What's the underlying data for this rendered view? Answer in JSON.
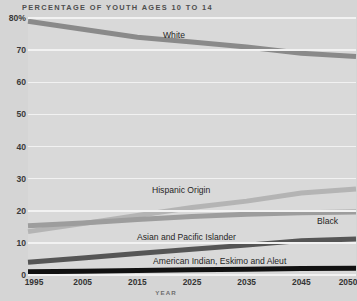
{
  "chart_data": {
    "type": "line",
    "title": "PERCENTAGE OF YOUTH AGES  10 TO 14",
    "xlabel": "YEAR",
    "ylabel": "",
    "grid": true,
    "legend_position": "inline-labels",
    "x": [
      1995,
      2005,
      2015,
      2025,
      2035,
      2045,
      2050
    ],
    "xticklabels": [
      "1995",
      "2005",
      "2015",
      "2025",
      "2035",
      "2045",
      "2050"
    ],
    "xlim": [
      1995,
      2050
    ],
    "ylim": [
      0,
      80
    ],
    "yticks": [
      0,
      10,
      20,
      30,
      40,
      50,
      60,
      70,
      80
    ],
    "yticklabels": [
      "0",
      "10",
      "20",
      "30",
      "40",
      "50",
      "60",
      "70",
      "80%"
    ],
    "series": [
      {
        "name": "White",
        "color": "#8a8a8a",
        "values": [
          79.0,
          76.5,
          74.0,
          72.5,
          71.0,
          69.0,
          68.0
        ]
      },
      {
        "name": "Hispanic Origin",
        "color": "#b4b4b4",
        "values": [
          13.5,
          16.0,
          18.5,
          21.0,
          23.0,
          25.5,
          26.8
        ]
      },
      {
        "name": "Black",
        "color": "#9d9d9d",
        "values": [
          15.3,
          16.2,
          17.3,
          18.2,
          18.9,
          19.4,
          19.6
        ]
      },
      {
        "name": "Asian and Pacific Islander",
        "color": "#555555",
        "values": [
          4.0,
          5.3,
          6.7,
          8.0,
          9.3,
          10.7,
          11.2
        ]
      },
      {
        "name": "American Indian, Eskimo and Aleut",
        "color": "#111111",
        "values": [
          1.0,
          1.2,
          1.4,
          1.6,
          1.8,
          2.0,
          2.1
        ]
      }
    ]
  },
  "labels": {
    "white": "White",
    "hispanic": "Hispanic Origin",
    "black": "Black",
    "asian": "Asian and Pacific Islander",
    "amerindian": "American Indian, Eskimo and Aleut"
  },
  "colors": {
    "background": "#d5d5d5",
    "plot_background": "#d9d9d9",
    "gridline": "#f2f2f2",
    "title_text": "#4e4e4e",
    "tick_text": "#333333"
  }
}
